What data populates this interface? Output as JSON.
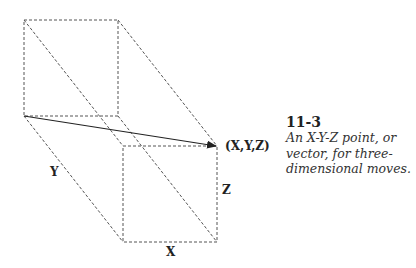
{
  "figure": {
    "labels": {
      "y_axis": "Y",
      "x_axis": "X",
      "z_axis": "Z",
      "point": "(X,Y,Z)"
    },
    "caption": {
      "number": "11-3",
      "lines": [
        "An X-Y-Z point, or",
        "vector, for three-",
        "dimensional moves."
      ]
    },
    "colors": {
      "edge": "#555555",
      "vector": "#222222",
      "background": "#ffffff"
    }
  }
}
